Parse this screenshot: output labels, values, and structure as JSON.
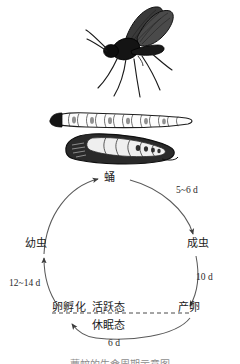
{
  "figure": {
    "kind": "insect-life-cycle-diagram",
    "language": "zh",
    "caption": "蕈蚊的生命周期示意图"
  },
  "illustrations": [
    {
      "id": "adult-gnat",
      "name": "adult-gnat-illustration",
      "label": "成虫（蕈蚊）"
    },
    {
      "id": "larva",
      "name": "larva-illustration",
      "label": "幼虫"
    },
    {
      "id": "pupa",
      "name": "pupa-illustration",
      "label": "蛹"
    }
  ],
  "cycle": {
    "nodes": [
      {
        "id": "pupa",
        "label": "蛹",
        "position": "top"
      },
      {
        "id": "adult",
        "label": "成虫",
        "position": "right"
      },
      {
        "id": "oviposit",
        "label": "产卵",
        "position": "bottom-right"
      },
      {
        "id": "hatch",
        "label": "卵孵化",
        "position": "bottom-left"
      },
      {
        "id": "larva",
        "label": "幼虫",
        "position": "left"
      }
    ],
    "durations": [
      {
        "id": "pupa-adult",
        "label": "5~6 d",
        "from": "蛹",
        "to": "成虫"
      },
      {
        "id": "adult-ovi",
        "label": "10 d",
        "from": "成虫",
        "to": "产卵"
      },
      {
        "id": "ovi-hatch",
        "label": "6 d",
        "from": "产卵",
        "to": "卵孵化"
      },
      {
        "id": "hatch-larva",
        "label": "12~14 d",
        "from": "卵孵化",
        "to": "幼虫"
      }
    ],
    "states": {
      "active": "活跃态",
      "dormant": "休眠态"
    },
    "divider": "dashed-horizontal-line"
  },
  "colors": {
    "ink": "#1b1b1b",
    "line": "#555555",
    "background": "#ffffff"
  }
}
